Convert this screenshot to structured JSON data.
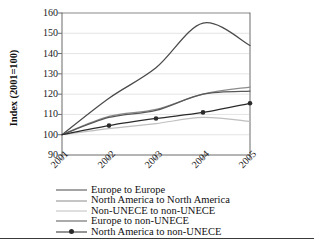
{
  "chart_data": {
    "type": "line",
    "title": "",
    "xlabel": "",
    "ylabel": "Index (2001=100)",
    "categories": [
      "2001",
      "2002",
      "2003",
      "2004",
      "2005"
    ],
    "x": [
      2001,
      2002,
      2003,
      2004,
      2005
    ],
    "ylim": [
      90,
      160
    ],
    "yticks": [
      90,
      100,
      110,
      120,
      130,
      140,
      150,
      160
    ],
    "grid": "horizontal",
    "legend_position": "below",
    "series": [
      {
        "name": "Europe to Europe",
        "values": [
          100,
          118,
          133,
          155,
          144
        ],
        "color": "#4a4a4a",
        "marker": "none"
      },
      {
        "name": "North America to North America",
        "values": [
          100,
          109,
          112.5,
          120,
          123.5
        ],
        "color": "#8c8c8c",
        "marker": "none"
      },
      {
        "name": "Non-UNECE to non-UNECE",
        "values": [
          100,
          103,
          105.5,
          108.5,
          106.5
        ],
        "color": "#bfbfbf",
        "marker": "none"
      },
      {
        "name": "Europe to non-UNECE",
        "values": [
          100,
          108.5,
          112,
          120,
          121.5
        ],
        "color": "#585858",
        "marker": "none"
      },
      {
        "name": "North America to non-UNECE",
        "values": [
          100,
          104.5,
          108,
          111,
          115.5
        ],
        "color": "#2b2b2b",
        "marker": "circle"
      }
    ]
  },
  "axis": {
    "y_title": "Index (2001=100)",
    "y_ticks": [
      "160",
      "150",
      "140",
      "130",
      "120",
      "110",
      "100",
      "90"
    ],
    "x_ticks": [
      "2001",
      "2002",
      "2003",
      "2004",
      "2005"
    ]
  },
  "legend": {
    "items": [
      {
        "label": "Europe to Europe"
      },
      {
        "label": "North America to North America"
      },
      {
        "label": "Non-UNECE to non-UNECE"
      },
      {
        "label": "Europe to non-UNECE"
      },
      {
        "label": "North America to non-UNECE"
      }
    ]
  }
}
